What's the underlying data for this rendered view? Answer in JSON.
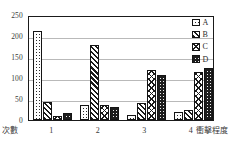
{
  "chart_data": {
    "type": "bar",
    "title": "",
    "xlabel": "衝擊程度",
    "ylabel": "次數",
    "categories": [
      "1",
      "2",
      "3",
      "4"
    ],
    "ylim": [
      0,
      250
    ],
    "yticks": [
      "0",
      "50",
      "100",
      "150",
      "200",
      "250"
    ],
    "grid": true,
    "legend_position": "top-right",
    "series": [
      {
        "name": "A",
        "pattern": "white-dotted",
        "values": [
          212,
          35,
          12,
          18
        ]
      },
      {
        "name": "B",
        "pattern": "dark-diagonal-hatch",
        "values": [
          42,
          178,
          41,
          23
        ]
      },
      {
        "name": "C",
        "pattern": "cross-hatch",
        "values": [
          10,
          35,
          119,
          115
        ]
      },
      {
        "name": "D",
        "pattern": "dark-solid-dotted",
        "values": [
          17,
          31,
          108,
          123
        ]
      }
    ]
  },
  "axes": {
    "y_ticks": [
      {
        "label": "250",
        "value": 250
      },
      {
        "label": "200",
        "value": 200
      },
      {
        "label": "150",
        "value": 150
      },
      {
        "label": "100",
        "value": 100
      },
      {
        "label": "50",
        "value": 50
      },
      {
        "label": "0",
        "value": 0
      }
    ],
    "x_ticks": [
      "1",
      "2",
      "3",
      "4"
    ],
    "x_label_left": "次數",
    "x_label_right": "衝擊程度"
  },
  "legend": {
    "items": [
      {
        "label": "A"
      },
      {
        "label": "B"
      },
      {
        "label": "C"
      },
      {
        "label": "D"
      }
    ]
  }
}
